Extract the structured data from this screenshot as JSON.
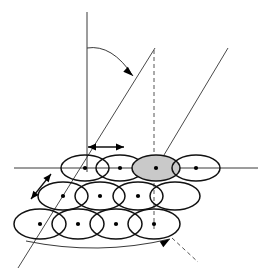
{
  "figure": {
    "background_color": "#ffffff"
  },
  "colors": {
    "line": "#3a3a3a",
    "ray": "#4a4a4a",
    "dashed": "#555555",
    "ellipse_stroke": "#111111",
    "ellipse_fill_none": "none",
    "ellipse_fill_shaded": "#c9c9c9",
    "dot": "#000000",
    "arrow": "#000000"
  },
  "axes": {
    "vertical_axis": {
      "name": "vertical-reference-axis",
      "x1": 87,
      "y1": 12,
      "x2": 87,
      "y2": 172,
      "style": "solid"
    },
    "horizontal_axis": {
      "name": "horizontal-ground-line",
      "x1": 14,
      "y1": 168,
      "x2": 258,
      "y2": 168,
      "style": "solid"
    }
  },
  "rays": [
    {
      "name": "scan-ray-left",
      "label": "left slanted ray",
      "x1": 155,
      "y1": 48,
      "x2": 18,
      "y2": 268,
      "style": "solid"
    },
    {
      "name": "scan-ray-right",
      "label": "right slanted ray",
      "x1": 228,
      "y1": 48,
      "x2": 155,
      "y2": 170,
      "style": "solid"
    },
    {
      "name": "nadir-dashed-ray",
      "label": "dashed vertical drop line",
      "x1": 154,
      "y1": 50,
      "x2": 154,
      "y2": 230,
      "style": "dashed"
    },
    {
      "name": "footprint-trace-dashed",
      "label": "dashed footprint trace",
      "x1": 172,
      "y1": 238,
      "x2": 198,
      "y2": 262,
      "style": "dashed"
    }
  ],
  "angle_arc": {
    "name": "incidence-angle-arc",
    "description": "Curved arc from vertical axis sweeping right to the left scan ray, with arrowhead",
    "start_x": 87,
    "start_y": 48,
    "end_x": 133,
    "end_y": 76,
    "control_x": 112,
    "control_y": 44,
    "arrow_at": "end",
    "arrow_angle_deg": 42
  },
  "swath_arc": {
    "name": "swath-width-arc",
    "description": "Shallow arc along the bottom of the footprint grid with arrowhead at the right end",
    "start_x": 26,
    "start_y": 241,
    "end_x": 170,
    "end_y": 239,
    "control_x": 98,
    "control_y": 256,
    "arrow_at": "end",
    "arrow_angle_deg": -32
  },
  "dimension_arrows": [
    {
      "name": "along-track-spacing-arrow",
      "description": "Horizontal double headed arrow showing sample spacing",
      "orientation": "horizontal",
      "x1": 88,
      "y1": 147,
      "x2": 124,
      "y2": 147,
      "double_headed": true
    },
    {
      "name": "cross-track-spacing-arrow",
      "description": "Diagonal double headed arrow at about 45 degrees on the left",
      "orientation": "diagonal",
      "x1": 31,
      "y1": 199,
      "x2": 51,
      "y2": 174,
      "double_headed": true
    }
  ],
  "footprint_grid": {
    "name": "footprint-ellipse-grid",
    "rows": [
      {
        "name": "footprint-row-1",
        "row_index": 1,
        "cy": 168,
        "rx": 24,
        "ry": 13,
        "cells": [
          {
            "name": "footprint-cell-1-1",
            "cx": 85,
            "shaded": false,
            "has_dot": true
          },
          {
            "name": "footprint-cell-1-2",
            "cx": 120,
            "shaded": false,
            "has_dot": true
          },
          {
            "name": "footprint-cell-1-3",
            "cx": 156,
            "shaded": true,
            "has_dot": true
          },
          {
            "name": "footprint-cell-1-4",
            "cx": 196,
            "shaded": false,
            "has_dot": true
          }
        ]
      },
      {
        "name": "footprint-row-2",
        "row_index": 2,
        "cy": 196,
        "rx": 25,
        "ry": 14,
        "cells": [
          {
            "name": "footprint-cell-2-1",
            "cx": 63,
            "shaded": false,
            "has_dot": true
          },
          {
            "name": "footprint-cell-2-2",
            "cx": 100,
            "shaded": false,
            "has_dot": true
          },
          {
            "name": "footprint-cell-2-3",
            "cx": 138,
            "shaded": false,
            "has_dot": true
          },
          {
            "name": "footprint-cell-2-4",
            "cx": 175,
            "shaded": false,
            "has_dot": false
          }
        ]
      },
      {
        "name": "footprint-row-3",
        "row_index": 3,
        "cy": 224,
        "rx": 26,
        "ry": 15,
        "cells": [
          {
            "name": "footprint-cell-3-1",
            "cx": 40,
            "shaded": false,
            "has_dot": true
          },
          {
            "name": "footprint-cell-3-2",
            "cx": 78,
            "shaded": false,
            "has_dot": true
          },
          {
            "name": "footprint-cell-3-3",
            "cx": 116,
            "shaded": false,
            "has_dot": true
          },
          {
            "name": "footprint-cell-3-4",
            "cx": 154,
            "shaded": false,
            "has_dot": true
          }
        ]
      }
    ]
  },
  "labels": []
}
